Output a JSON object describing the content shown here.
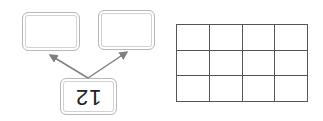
{
  "diagram": {
    "type": "number-bond",
    "whole": "12",
    "whole_rotated": true,
    "parts": [
      "",
      ""
    ]
  },
  "grid": {
    "rows": 3,
    "columns": 4,
    "cells": [
      [
        "",
        "",
        "",
        ""
      ],
      [
        "",
        "",
        "",
        ""
      ],
      [
        "",
        "",
        "",
        ""
      ]
    ]
  },
  "colors": {
    "box_border": "#b8b8b8",
    "arrow": "#808080",
    "grid_line": "#555555"
  }
}
